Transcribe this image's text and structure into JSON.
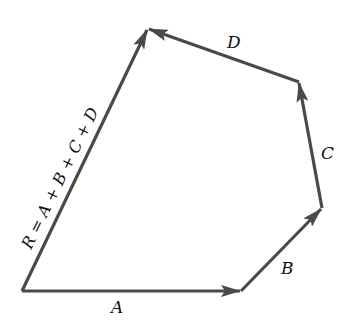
{
  "diagram": {
    "stroke_color": "#4a4a4a",
    "label_color": "#111111",
    "background": "#ffffff",
    "points": {
      "origin": [
        22,
        291
      ],
      "after_A": [
        241,
        291
      ],
      "after_B": [
        322,
        208
      ],
      "after_C": [
        299,
        82
      ],
      "after_D": [
        148,
        29
      ]
    },
    "vectors": [
      {
        "id": "A",
        "label": "A",
        "from": "origin",
        "to": "after_A"
      },
      {
        "id": "B",
        "label": "B",
        "from": "after_A",
        "to": "after_B"
      },
      {
        "id": "C",
        "label": "C",
        "from": "after_B",
        "to": "after_C"
      },
      {
        "id": "D",
        "label": "D",
        "from": "after_C",
        "to": "after_D"
      },
      {
        "id": "R",
        "label": "R = A + B + C + D",
        "from": "origin",
        "to": "after_D"
      }
    ],
    "labels": {
      "A": "A",
      "B": "B",
      "C": "C",
      "D": "D",
      "R": "R = A + B + C + D"
    }
  }
}
